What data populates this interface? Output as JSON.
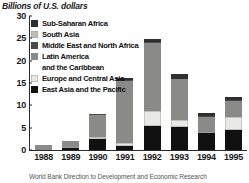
{
  "figure": {
    "axis_title": "Billions of U.S. dollars",
    "caption": "World Bank Direction to Development and Economic Research"
  },
  "chart_data": {
    "type": "bar",
    "stacked": true,
    "title": "Billions of U.S. dollars",
    "xlabel": "",
    "ylabel": "Billions of U.S. dollars",
    "ylim": [
      0,
      30
    ],
    "yticks": [
      0,
      5,
      10,
      15,
      20,
      25,
      30
    ],
    "ytick_labels": [
      "0",
      "5",
      "10",
      "15",
      "20",
      "25",
      "30"
    ],
    "grid": false,
    "legend_position": "upper-left-inside",
    "categories": [
      "1988",
      "1989",
      "1990",
      "1991",
      "1992",
      "1993",
      "1994",
      "1995"
    ],
    "series": [
      {
        "name": "East Asia and the Pacific",
        "color": "#111111",
        "values": [
          0.0,
          0.4,
          2.4,
          0.9,
          5.3,
          5.1,
          3.8,
          4.4
        ]
      },
      {
        "name": "Europe and Central Asia",
        "color": "#e8e8e4",
        "values": [
          0.0,
          0.3,
          0.5,
          0.6,
          3.4,
          1.6,
          0.2,
          2.9
        ]
      },
      {
        "name": "Latin America and the Caribbean",
        "color": "#8a8a88",
        "values": [
          1.2,
          1.4,
          5.0,
          14.0,
          15.2,
          9.1,
          3.5,
          3.6
        ]
      },
      {
        "name": "Middle East and North Africa",
        "color": "#4a4a4a",
        "values": [
          0.0,
          0.0,
          0.1,
          0.1,
          0.2,
          0.1,
          0.1,
          0.2
        ]
      },
      {
        "name": "South Asia",
        "color": "#bcbcb8",
        "values": [
          0.0,
          0.0,
          0.0,
          0.1,
          0.1,
          0.1,
          0.1,
          0.1
        ]
      },
      {
        "name": "Sub-Saharan Africa",
        "color": "#2f2f2f",
        "values": [
          0.0,
          0.0,
          0.1,
          0.4,
          0.7,
          1.0,
          0.5,
          0.7
        ]
      }
    ],
    "totals": [
      1.2,
      2.1,
      8.1,
      16.1,
      24.9,
      17.0,
      8.2,
      11.9
    ]
  },
  "legend": {
    "items": [
      {
        "label": "Sub-Saharan Africa",
        "color": "#2f2f2f",
        "swatch": true
      },
      {
        "label": "South Asia",
        "color": "#bcbcb8",
        "swatch": true
      },
      {
        "label": "Middle East and North Africa",
        "color": "#4a4a4a",
        "swatch": true
      },
      {
        "label": "Latin America",
        "color": "#8a8a88",
        "swatch": true
      },
      {
        "label": "and the Caribbean",
        "color": "",
        "swatch": false
      },
      {
        "label": "Europe and Central Asia",
        "color": "#e8e8e4",
        "swatch": true
      },
      {
        "label": "East Asia and the Pacific",
        "color": "#111111",
        "swatch": true
      }
    ]
  }
}
